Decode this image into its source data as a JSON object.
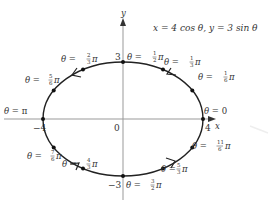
{
  "diagram": {
    "title_equation": "x = 4 cos θ, y = 3 sin θ",
    "axes": {
      "x_label": "x",
      "y_label": "y",
      "origin_label": "0",
      "x_ticks": {
        "neg": "−4",
        "pos": "4"
      },
      "y_ticks": {
        "pos": "3",
        "neg": "−3"
      }
    },
    "ellipse": {
      "a": 4,
      "b": 3,
      "direction": "counterclockwise",
      "stroke_color": "#222222"
    },
    "points": [
      {
        "theta": "0",
        "label_prefix": "θ = ",
        "num": "",
        "den": "",
        "suffix": "0"
      },
      {
        "theta": "π/6",
        "label_prefix": "θ = ",
        "num": "1",
        "den": "6",
        "suffix": "π"
      },
      {
        "theta": "π/3",
        "label_prefix": "θ = ",
        "num": "1",
        "den": "3",
        "suffix": "π"
      },
      {
        "theta": "π/2",
        "label_prefix": "θ = ",
        "num": "1",
        "den": "2",
        "suffix": "π"
      },
      {
        "theta": "2π/3",
        "label_prefix": "θ = ",
        "num": "2",
        "den": "3",
        "suffix": "π"
      },
      {
        "theta": "5π/6",
        "label_prefix": "θ = ",
        "num": "5",
        "den": "6",
        "suffix": "π"
      },
      {
        "theta": "π",
        "label_prefix": "θ = ",
        "num": "",
        "den": "",
        "suffix": "π"
      },
      {
        "theta": "7π/6",
        "label_prefix": "θ = ",
        "num": "7",
        "den": "6",
        "suffix": "π"
      },
      {
        "theta": "4π/3",
        "label_prefix": "θ = ",
        "num": "4",
        "den": "3",
        "suffix": "π"
      },
      {
        "theta": "3π/2",
        "label_prefix": "θ = ",
        "num": "3",
        "den": "2",
        "suffix": "π"
      },
      {
        "theta": "5π/3",
        "label_prefix": "θ = ",
        "num": "5",
        "den": "3",
        "suffix": "π"
      },
      {
        "theta": "11π/6",
        "label_prefix": "θ = ",
        "num": "11",
        "den": "6",
        "suffix": "π"
      }
    ]
  }
}
